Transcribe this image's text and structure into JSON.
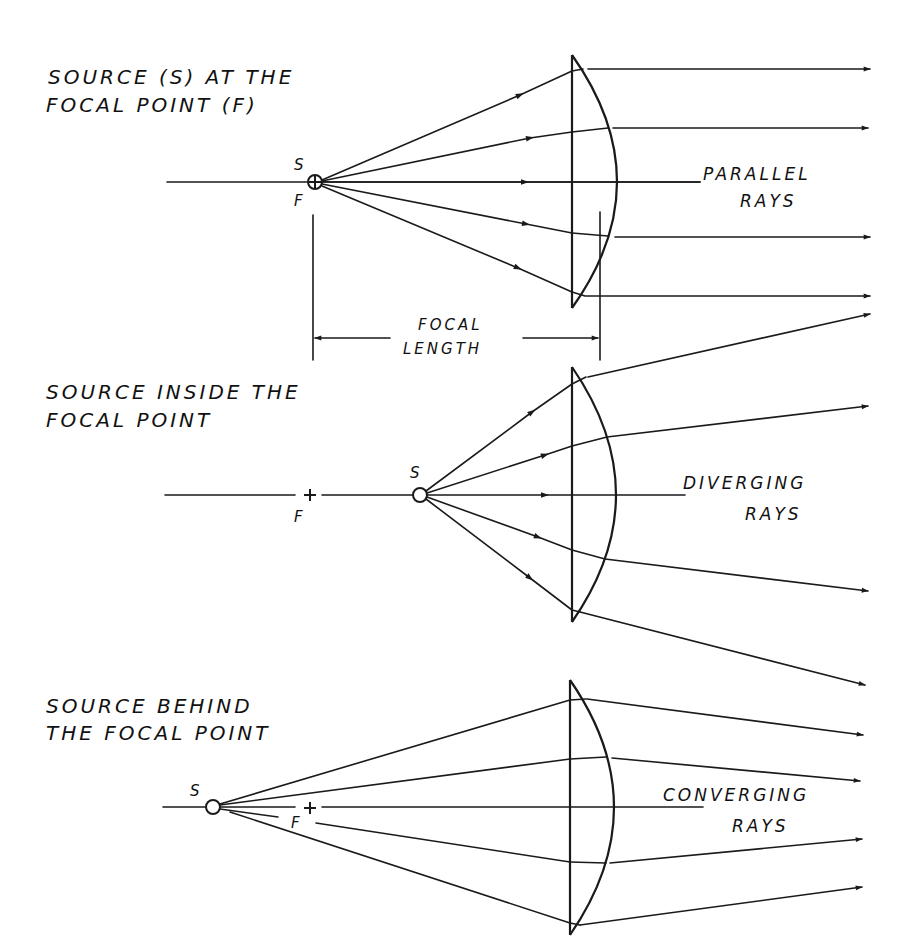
{
  "colors": {
    "ink": "#1a1a1a",
    "background": "#ffffff"
  },
  "sections": [
    {
      "id": "focal",
      "title_line1": "SOURCE (S) AT THE",
      "title_line2": "FOCAL POINT (F)",
      "source_label": "S",
      "focal_label": "F",
      "result_line1": "PARALLEL",
      "result_line2": "RAYS",
      "dimension_line1": "FOCAL",
      "dimension_line2": "LENGTH"
    },
    {
      "id": "inside",
      "title_line1": "SOURCE  INSIDE  THE",
      "title_line2": "FOCAL  POINT",
      "source_label": "S",
      "focal_label": "F",
      "result_line1": "DIVERGING",
      "result_line2": "RAYS"
    },
    {
      "id": "behind",
      "title_line1": "SOURCE  BEHIND",
      "title_line2": "THE FOCAL  POINT",
      "source_label": "S",
      "focal_label": "F",
      "result_line1": "CONVERGING",
      "result_line2": "RAYS"
    }
  ]
}
